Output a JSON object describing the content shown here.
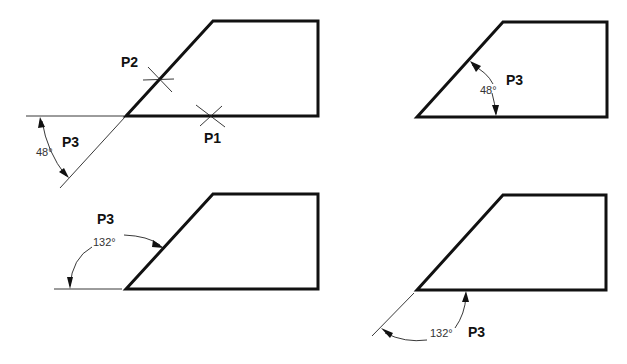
{
  "figure": {
    "panels": [
      {
        "id": "top-left",
        "description": "Picking two points on line then angle",
        "labels": {
          "p1": "P1",
          "p2": "P2",
          "p3": "P3"
        },
        "angle": "48°"
      },
      {
        "id": "top-right",
        "description": "Angle measured inside shape",
        "labels": {
          "p3": "P3"
        },
        "angle": "48°"
      },
      {
        "id": "bottom-left",
        "description": "Obtuse angle measured from extension line",
        "labels": {
          "p3": "P3"
        },
        "angle": "132°"
      },
      {
        "id": "bottom-right",
        "description": "Obtuse angle measured below shape",
        "labels": {
          "p3": "P3"
        },
        "angle": "132°"
      }
    ]
  },
  "colors": {
    "line": "#111111",
    "background": "#ffffff"
  }
}
